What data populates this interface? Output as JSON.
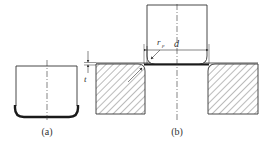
{
  "figure": {
    "colors": {
      "line": "#333333",
      "thick": "#1a1a1a",
      "hatch": "#555555",
      "background": "#ffffff"
    },
    "part_a": {
      "caption": "(a)"
    },
    "part_b": {
      "caption": "(b)",
      "labels": {
        "punch_radius": "r",
        "punch_radius_sub": "p",
        "diameter": "d",
        "thickness": "t"
      }
    }
  }
}
